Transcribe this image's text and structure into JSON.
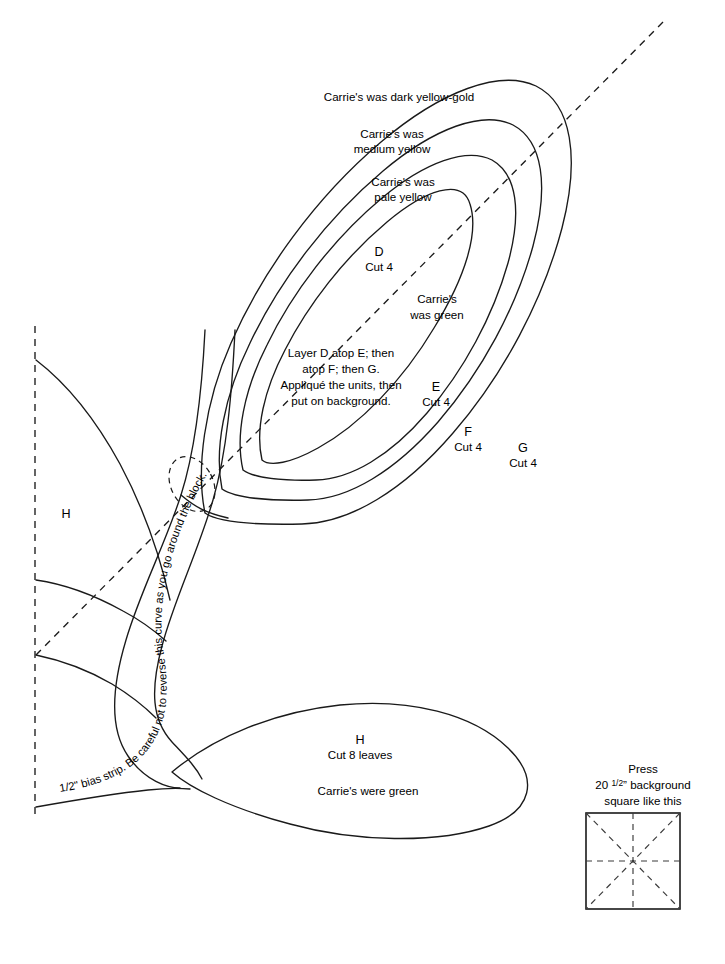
{
  "document": {
    "title": "Appliqué Flower Block Pattern Sheet"
  },
  "petals": {
    "g": {
      "letter": "G",
      "cut": "Cut 4",
      "note": "Carrie's was dark yellow-gold"
    },
    "f": {
      "letter": "F",
      "cut": "Cut 4",
      "note_line1": "Carrie's was",
      "note_line2": "medium yellow"
    },
    "e": {
      "letter": "E",
      "cut": "Cut 4",
      "note_line1": "Carrie's was",
      "note_line2": "pale yellow"
    },
    "d": {
      "letter": "D",
      "cut": "Cut 4",
      "note_line1": "Carrie's",
      "note_line2": "was green"
    }
  },
  "instructions": {
    "line1": "Layer D atop E; then",
    "line2": "atop F; then G.",
    "line3": "Appliqué the units, then",
    "line4": "put on background."
  },
  "stem": {
    "label": "1/2\" bias strip. Be careful not to reverse this curve as you go around the block."
  },
  "leaf": {
    "letter": "H",
    "cut": "Cut 8 leaves",
    "note": "Carrie's were green"
  },
  "background_leaf": {
    "letter": "H"
  },
  "legend": {
    "line1": "Press",
    "line2_prefix": "20 ",
    "line2_fraction": "1/2",
    "line2_suffix": "” background",
    "line3": "square like this"
  },
  "colors": {
    "ink": "#1a1a1a",
    "paper": "#ffffff"
  }
}
